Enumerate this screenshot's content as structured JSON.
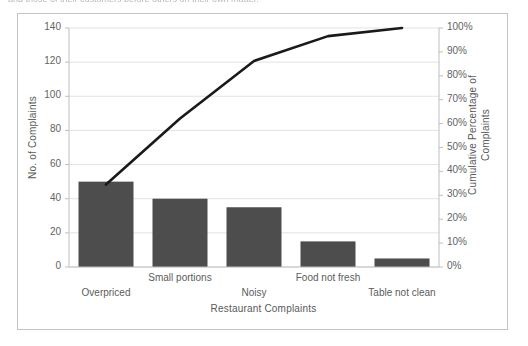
{
  "top_caption": {
    "text": "and those of their customers before others on their own matter."
  },
  "colors": {
    "bar_fill": "#4d4d4d",
    "line_stroke": "#1a1a1a",
    "gridline": "#e3e3e3",
    "axis_line": "#bfbfbf",
    "frame_border": "#c4c4c4",
    "tick_text": "#636363",
    "title_text": "#595959",
    "plot_background": "#ffffff"
  },
  "chart_data": {
    "type": "bar",
    "title": "",
    "subtitle": "",
    "xlabel": "Restaurant Complaints",
    "ylabel": "No. of Complaints",
    "categories": [
      "Overpriced",
      "Small portions",
      "Noisy",
      "Food not fresh",
      "Table not clean"
    ],
    "values": [
      50,
      40,
      35,
      15,
      5
    ],
    "ylim": [
      0,
      140
    ],
    "ytick_step": 20,
    "ytick_labels": [
      "0",
      "20",
      "40",
      "60",
      "80",
      "100",
      "120",
      "140"
    ],
    "ytick_values": [
      0,
      20,
      40,
      60,
      80,
      100,
      120,
      140
    ],
    "grid": true,
    "legend": "none",
    "secondary_axis": {
      "label_line1": "Cumulative Percentage of",
      "label_line2": "Complaints",
      "ylim": [
        0,
        100
      ],
      "ytick_step": 10,
      "ytick_labels": [
        "0%",
        "10%",
        "20%",
        "30%",
        "40%",
        "50%",
        "60%",
        "70%",
        "80%",
        "90%",
        "100%"
      ],
      "ytick_values": [
        0,
        10,
        20,
        30,
        40,
        50,
        60,
        70,
        80,
        90,
        100
      ]
    },
    "series": [
      {
        "name": "No. of Complaints",
        "type": "bar",
        "axis": "left",
        "values": [
          50,
          40,
          35,
          15,
          5
        ]
      },
      {
        "name": "Cumulative Percentage of Complaints",
        "type": "line",
        "axis": "right",
        "values": [
          34.5,
          62.1,
          86.2,
          96.6,
          100.0
        ]
      }
    ],
    "total_complaints": 145
  },
  "geometry": {
    "plot_left": 51,
    "plot_right": 421,
    "plot_top": 14,
    "plot_bottom": 253,
    "bar_width_px": 55,
    "category_slot_px": 74
  },
  "category_label_rows": [
    1,
    0,
    1,
    0,
    1
  ]
}
